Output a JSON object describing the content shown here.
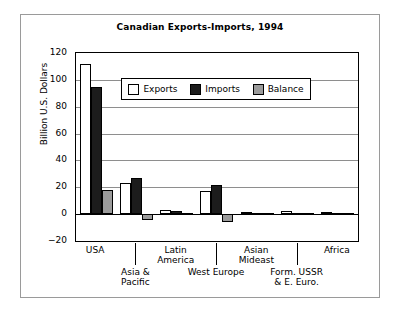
{
  "figure": {
    "title": "Canadian Exports-Imports, 1994",
    "ylabel": "Billion U.S. Dollars"
  },
  "legend": {
    "items": [
      {
        "label": "Exports",
        "color": "#ffffff",
        "swatch": "exports"
      },
      {
        "label": "Imports",
        "color": "#1c1c1c",
        "swatch": "imports"
      },
      {
        "label": "Balance",
        "color": "#9b9b9b",
        "swatch": "balance"
      }
    ]
  },
  "yaxis": {
    "ticks": [
      "120",
      "100",
      "80",
      "60",
      "40",
      "20",
      "0",
      "−20"
    ],
    "values": [
      120,
      100,
      80,
      60,
      40,
      20,
      0,
      -20
    ]
  },
  "chart_data": {
    "type": "bar",
    "title": "Canadian Exports-Imports, 1994",
    "xlabel": "",
    "ylabel": "Billion U.S. Dollars",
    "ylim": [
      -20,
      120
    ],
    "ytick_step": 20,
    "grid": true,
    "legend_position": "inside-top-center",
    "categories": [
      "USA",
      "Asia & Pacific",
      "Latin America",
      "West Europe",
      "Asian Mideast",
      "Form. USSR & E. Euro.",
      "Africa"
    ],
    "category_label_lines": [
      [
        "USA"
      ],
      [
        "Asia &",
        "Pacific"
      ],
      [
        "Latin",
        "America"
      ],
      [
        "West Europe"
      ],
      [
        "Asian",
        "Mideast"
      ],
      [
        "Form. USSR",
        "& E. Euro."
      ],
      [
        "Africa"
      ]
    ],
    "series": [
      {
        "name": "Exports",
        "color": "#ffffff",
        "values": [
          112,
          23,
          3,
          17,
          1.5,
          2,
          1.5
        ]
      },
      {
        "name": "Imports",
        "color": "#1c1c1c",
        "values": [
          95,
          27,
          2,
          22,
          1,
          1,
          1
        ]
      },
      {
        "name": "Balance",
        "color": "#9b9b9b",
        "values": [
          18,
          -4,
          1,
          -6,
          0.8,
          1.2,
          1.2
        ]
      }
    ]
  }
}
